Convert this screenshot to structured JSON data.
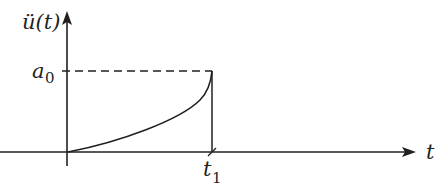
{
  "diagram": {
    "y_axis_label": "ü(t)",
    "x_axis_label": "t",
    "level_label": "a",
    "level_subscript": "0",
    "time_label": "t",
    "time_subscript": "1",
    "line_color": "#231f20",
    "background": "#ffffff"
  }
}
